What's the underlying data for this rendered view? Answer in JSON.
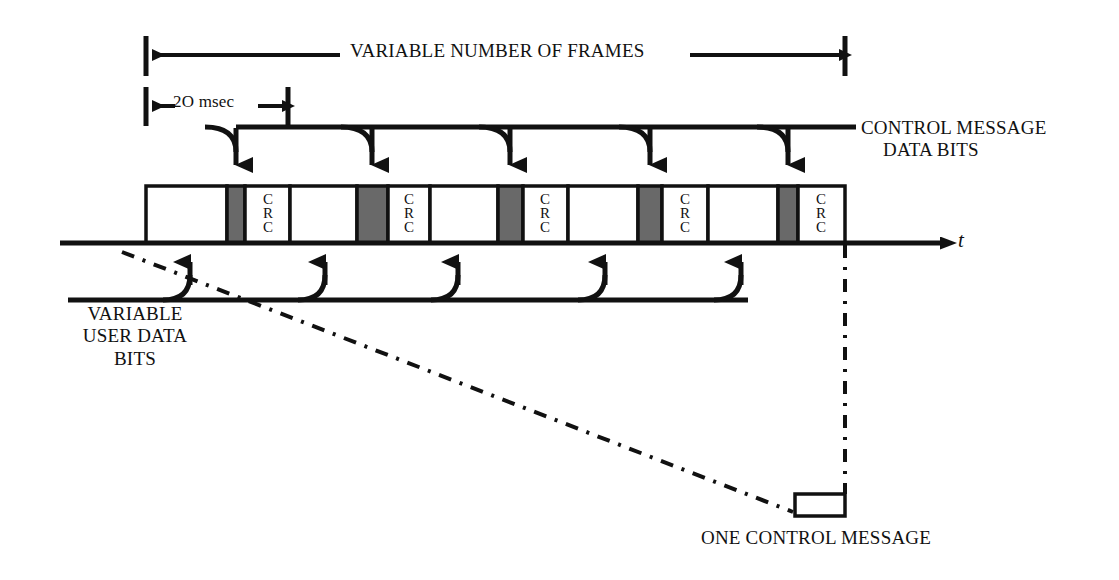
{
  "diagram": {
    "colors": {
      "ink": "#111111",
      "control_block_fill": "#696969",
      "frame_fill": "#ffffff",
      "background": "#ffffff"
    },
    "labels": {
      "variable_number_of_frames": "VARIABLE NUMBER OF FRAMES",
      "frame_duration": "2O msec",
      "control_message_line1": "CONTROL MESSAGE",
      "control_message_line2": "DATA BITS",
      "user_data_line1": "VARIABLE",
      "user_data_line2": "USER DATA",
      "user_data_line3": "BITS",
      "one_control_message": "ONE CONTROL MESSAGE",
      "time_axis": "t",
      "crc_text": "C\nR\nC"
    },
    "frames": [
      {
        "index": 1,
        "user_x": 146,
        "user_w": 81,
        "ctrl_x": 227,
        "ctrl_w": 18,
        "crc_x": 245,
        "crc_w": 45
      },
      {
        "index": 2,
        "user_x": 290,
        "user_w": 67,
        "ctrl_x": 357,
        "ctrl_w": 31,
        "crc_x": 388,
        "crc_w": 42
      },
      {
        "index": 3,
        "user_x": 430,
        "user_w": 68,
        "ctrl_x": 498,
        "ctrl_w": 25,
        "crc_x": 523,
        "crc_w": 45
      },
      {
        "index": 4,
        "user_x": 568,
        "user_w": 70,
        "ctrl_x": 638,
        "ctrl_w": 24,
        "crc_x": 662,
        "crc_w": 46
      },
      {
        "index": 5,
        "user_x": 708,
        "user_w": 70,
        "ctrl_x": 778,
        "ctrl_w": 20,
        "crc_x": 798,
        "crc_w": 47
      }
    ],
    "geometry": {
      "bar_top": 186,
      "bar_bottom": 243,
      "axis_y": 243,
      "axis_x_start": 60,
      "axis_x_end": 952,
      "span_left_tick_x": 146,
      "span_right_tick_x": 845,
      "span_arrow_y": 55,
      "duration_tick_left_x": 146,
      "duration_tick_right_x": 288,
      "duration_arrow_y": 106,
      "control_feeder_line_y": 127,
      "control_feeder_x_end": 856,
      "user_feeder_line_y": 300,
      "user_feeder_x_start": 163,
      "user_feeder_x_end": 748,
      "callout_box_x": 795,
      "callout_box_y": 494,
      "callout_box_w": 50,
      "callout_box_h": 22
    },
    "control_arrow_targets": [
      236,
      372,
      510,
      650,
      788
    ],
    "user_arrow_targets": [
      190,
      325,
      458,
      605,
      741
    ]
  }
}
